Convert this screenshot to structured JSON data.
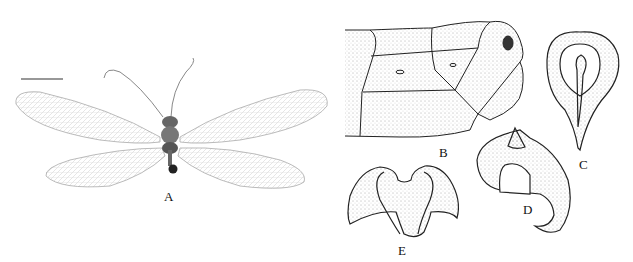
{
  "figure": {
    "panels": [
      {
        "id": "A",
        "label": "A",
        "content": "lacewing-habitus-photo",
        "scale_bar": true
      },
      {
        "id": "B",
        "label": "B",
        "content": "abdomen-apex-lateral-drawing"
      },
      {
        "id": "C",
        "label": "C",
        "content": "genitalia-structure-drawing"
      },
      {
        "id": "D",
        "label": "D",
        "content": "genitalia-structure-drawing"
      },
      {
        "id": "E",
        "label": "E",
        "content": "genitalia-structure-drawing"
      }
    ]
  }
}
